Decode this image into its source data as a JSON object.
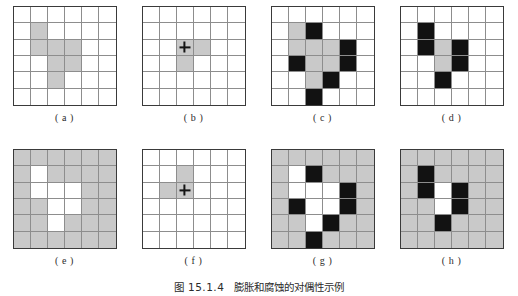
{
  "scan_header": "",
  "figure": {
    "caption_number": "图 15.1.4",
    "caption_text": "膨胀和腐蚀的对偶性示例",
    "grid_rows": 6,
    "grid_cols": 6,
    "colors": {
      "gray": "#c9c9c9",
      "black": "#121212",
      "white": "#ffffff",
      "border": "#3a3a3a",
      "gridline": "#8d8d8d"
    },
    "panels": [
      {
        "id": "a",
        "label": "( a )",
        "background": "white",
        "marker": null,
        "gray_cells": [
          [
            1,
            1
          ],
          [
            2,
            1
          ],
          [
            2,
            2
          ],
          [
            2,
            3
          ],
          [
            3,
            2
          ],
          [
            3,
            3
          ],
          [
            4,
            2
          ]
        ],
        "black_cells": [],
        "white_cells": []
      },
      {
        "id": "b",
        "label": "( b )",
        "background": "white",
        "marker": {
          "type": "plus",
          "cell": [
            2,
            2
          ]
        },
        "gray_cells": [
          [
            2,
            2
          ],
          [
            2,
            3
          ],
          [
            3,
            2
          ]
        ],
        "black_cells": [],
        "white_cells": []
      },
      {
        "id": "c",
        "label": "( c )",
        "background": "white",
        "marker": null,
        "gray_cells": [
          [
            1,
            1
          ],
          [
            2,
            1
          ],
          [
            2,
            2
          ],
          [
            2,
            3
          ],
          [
            3,
            2
          ],
          [
            3,
            3
          ],
          [
            4,
            2
          ]
        ],
        "black_cells": [
          [
            1,
            2
          ],
          [
            2,
            4
          ],
          [
            3,
            1
          ],
          [
            3,
            4
          ],
          [
            4,
            3
          ],
          [
            5,
            2
          ]
        ],
        "white_cells": []
      },
      {
        "id": "d",
        "label": "( d )",
        "background": "white",
        "marker": null,
        "gray_cells": [
          [
            2,
            2
          ],
          [
            3,
            2
          ]
        ],
        "black_cells": [
          [
            1,
            1
          ],
          [
            2,
            1
          ],
          [
            2,
            3
          ],
          [
            3,
            3
          ],
          [
            4,
            2
          ]
        ],
        "white_cells": []
      },
      {
        "id": "e",
        "label": "( e )",
        "background": "gray",
        "marker": null,
        "gray_cells": [],
        "black_cells": [],
        "white_cells": [
          [
            1,
            1
          ],
          [
            2,
            1
          ],
          [
            2,
            2
          ],
          [
            2,
            3
          ],
          [
            3,
            2
          ],
          [
            3,
            3
          ],
          [
            4,
            2
          ]
        ]
      },
      {
        "id": "f",
        "label": "( f )",
        "background": "white",
        "marker": {
          "type": "plus",
          "cell": [
            2,
            2
          ]
        },
        "gray_cells": [
          [
            1,
            2
          ],
          [
            2,
            1
          ],
          [
            2,
            2
          ]
        ],
        "black_cells": [],
        "white_cells": []
      },
      {
        "id": "g",
        "label": "( g )",
        "background": "gray",
        "marker": null,
        "gray_cells": [],
        "black_cells": [
          [
            1,
            2
          ],
          [
            2,
            4
          ],
          [
            3,
            1
          ],
          [
            3,
            4
          ],
          [
            4,
            3
          ],
          [
            5,
            2
          ]
        ],
        "white_cells": [
          [
            1,
            1
          ],
          [
            2,
            1
          ],
          [
            2,
            2
          ],
          [
            2,
            3
          ],
          [
            3,
            2
          ],
          [
            3,
            3
          ],
          [
            4,
            2
          ]
        ]
      },
      {
        "id": "h",
        "label": "( h )",
        "background": "gray",
        "marker": null,
        "gray_cells": [],
        "black_cells": [
          [
            1,
            1
          ],
          [
            2,
            1
          ],
          [
            2,
            3
          ],
          [
            3,
            3
          ],
          [
            4,
            2
          ]
        ],
        "white_cells": [
          [
            2,
            2
          ],
          [
            3,
            2
          ]
        ]
      }
    ]
  }
}
